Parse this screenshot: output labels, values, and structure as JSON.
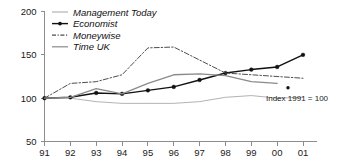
{
  "chart_data": {
    "type": "line",
    "title": "",
    "xlabel": "",
    "ylabel": "",
    "annotation": "Index 1991 = 100",
    "grid": false,
    "legend_position": "top-left",
    "categories": [
      "91",
      "92",
      "93",
      "94",
      "95",
      "96",
      "97",
      "98",
      "99",
      "00",
      "01"
    ],
    "x_tick_labels": [
      "91",
      "92",
      "93",
      "94",
      "95",
      "96",
      "97",
      "98",
      "99",
      "00",
      "01"
    ],
    "y_tick_labels": [
      "50",
      "100",
      "150",
      "200"
    ],
    "y_ticks": [
      50,
      100,
      150,
      200
    ],
    "ylim": [
      50,
      200
    ],
    "series": [
      {
        "name": "Management Today",
        "color": "#b3b3b3",
        "style": "solid",
        "marker": "none",
        "width": 1,
        "values": [
          100,
          100,
          96,
          94,
          94,
          94,
          96,
          101,
          103,
          100,
          101
        ]
      },
      {
        "name": "Economist",
        "color": "#111111",
        "style": "solid",
        "marker": "dot",
        "width": 1.4,
        "values": [
          100,
          101,
          106,
          105,
          109,
          113,
          121,
          129,
          133,
          136,
          150
        ]
      },
      {
        "name": "Moneywise",
        "color": "#4d4d4d",
        "style": "dashdot",
        "marker": "none",
        "width": 1,
        "values": [
          100,
          117,
          119,
          127,
          158,
          159,
          144,
          129,
          127,
          125,
          123
        ]
      },
      {
        "name": "Time UK",
        "color": "#8a8a8a",
        "style": "solid",
        "marker": "none",
        "width": 1.3,
        "values": [
          100,
          101,
          111,
          105,
          117,
          127,
          128,
          126,
          119,
          117,
          null
        ]
      }
    ],
    "stray_marker": {
      "series": "Economist",
      "x": "01",
      "value": 112
    }
  },
  "legend": {
    "items": [
      {
        "label": "Management Today",
        "marker": "line",
        "color": "#b3b3b3"
      },
      {
        "label": "Economist",
        "marker": "line-dot",
        "color": "#111111"
      },
      {
        "label": "Moneywise",
        "marker": "dashdot",
        "color": "#4d4d4d"
      },
      {
        "label": "Time UK",
        "marker": "line",
        "color": "#8a8a8a"
      }
    ]
  },
  "axis": {
    "y_labels": [
      "200",
      "150",
      "100",
      "50"
    ],
    "x_labels": [
      "91",
      "92",
      "93",
      "94",
      "95",
      "96",
      "97",
      "98",
      "99",
      "00",
      "01"
    ]
  },
  "annotation": {
    "text": "Index 1991 = 100"
  }
}
